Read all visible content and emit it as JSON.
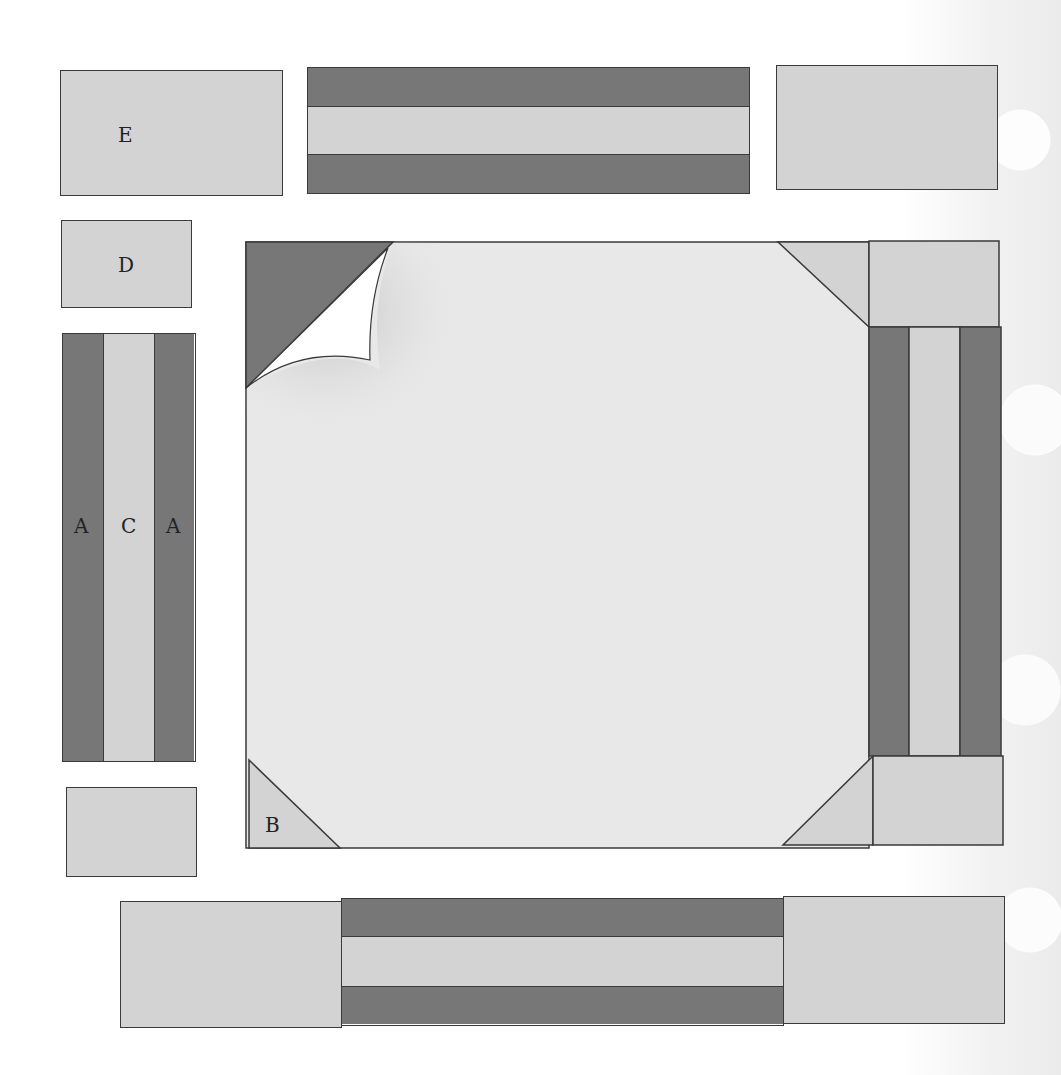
{
  "diagram": {
    "colors": {
      "dark": "#777777",
      "light": "#d3d3d3",
      "center": "#e8e8e8",
      "outline": "#3a3a3a",
      "curl": "#ffffff"
    },
    "labels": {
      "e": "E",
      "d": "D",
      "a_left": "A",
      "c": "C",
      "a_right": "A",
      "b": "B"
    },
    "pieces": [
      {
        "name": "E rectangle",
        "color": "light"
      },
      {
        "name": "top strip set",
        "stripes": [
          "dark",
          "light",
          "dark"
        ]
      },
      {
        "name": "top right rectangle",
        "color": "light"
      },
      {
        "name": "D rectangle",
        "color": "light"
      },
      {
        "name": "vertical strip set A-C-A",
        "stripes": [
          "dark",
          "light",
          "dark"
        ]
      },
      {
        "name": "lower left rectangle",
        "color": "light"
      },
      {
        "name": "center square with B corners",
        "corner_triangles": 4,
        "page_curl": "top-left"
      },
      {
        "name": "right strip column",
        "stripes": [
          "dark",
          "light",
          "dark"
        ]
      },
      {
        "name": "bottom strip set",
        "stripes": [
          "dark",
          "light",
          "dark"
        ]
      }
    ]
  }
}
